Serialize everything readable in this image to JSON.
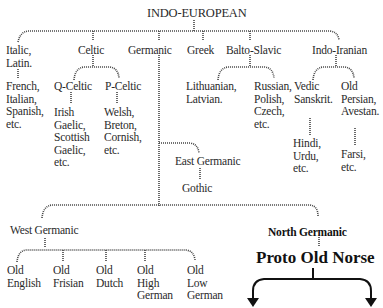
{
  "root": "INDO-EUROPEAN",
  "branches": {
    "italic": "Italic,\nLatin.",
    "italic_children": "French,\nItalian,\nSpanish,\netc.",
    "celtic": "Celtic",
    "q_celtic": "Q-Celtic",
    "q_celtic_children": "Irish\nGaelic,\nScottish\nGaelic,\netc.",
    "p_celtic": "P-Celtic",
    "p_celtic_children": "Welsh,\nBreton,\nCornish,\netc.",
    "germanic": "Germanic",
    "greek": "Greek",
    "balto_slavic": "Balto-Slavic",
    "baltic_children": "Lithuanian,\nLatvian.",
    "slavic_children": "Russian,\nPolish,\nCzech,\netc.",
    "indo_iranian": "Indo-Iranian",
    "vedic": "Vedic\nSanskrit.",
    "vedic_children": "Hindi,\nUrdu,\netc.",
    "old_persian": "Old\nPersian,\nAvestan.",
    "persian_children": "Farsi,\netc."
  },
  "germanic": {
    "east": "East Germanic",
    "east_child": "Gothic",
    "west": "West Germanic",
    "west_children": [
      "Old\nEnglish",
      "Old\nFrisian",
      "Old\nDutch",
      "Old\nHigh\nGerman",
      "Old\nLow\nGerman"
    ],
    "north": "North Germanic",
    "proto_old_norse": "Proto Old Norse"
  }
}
